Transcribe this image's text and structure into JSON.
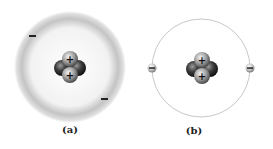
{
  "panels": [
    {
      "id": "a",
      "label": "(a)",
      "model": "electron-cloud",
      "nucleus": {
        "protons": 2,
        "neutrons": 2,
        "proton_symbol": "+"
      },
      "electrons": [
        {
          "symbol": "−"
        },
        {
          "symbol": "−"
        }
      ]
    },
    {
      "id": "b",
      "label": "(b)",
      "model": "orbit",
      "nucleus": {
        "protons": 2,
        "neutrons": 2,
        "proton_symbol": "+"
      },
      "electrons": [
        {
          "symbol": "−"
        },
        {
          "symbol": "−"
        }
      ]
    }
  ],
  "colors": {
    "cloud": "#bdbdbd",
    "orbit": "#c8c8c8",
    "proton": "#9a9a9a",
    "neutron": "#3a3a3a",
    "text": "#222222"
  }
}
